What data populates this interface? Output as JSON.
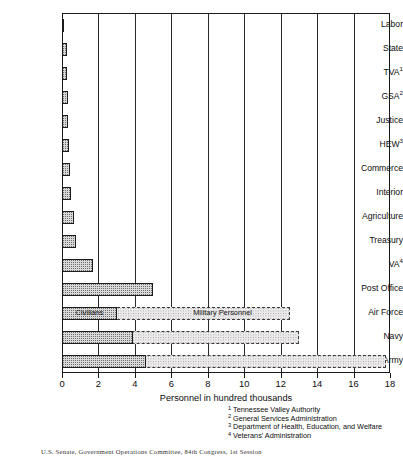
{
  "chart_data": {
    "type": "bar",
    "orientation": "horizontal",
    "title": "",
    "xlabel": "Personnel in hundred thousands",
    "ylabel": "",
    "xlim": [
      0,
      18
    ],
    "xticks": [
      0,
      2,
      4,
      6,
      8,
      10,
      12,
      14,
      16,
      18
    ],
    "grid": "vertical",
    "legend_position": "inside-bars",
    "categories": [
      "Labor",
      "State",
      "TVA",
      "GSA",
      "Justice",
      "HEW",
      "Commerce",
      "Interior",
      "Agriculture",
      "Treasury",
      "VA",
      "Post Office",
      "Air Force",
      "Navy",
      "Army"
    ],
    "category_labels": [
      {
        "text": "Labor",
        "sup": ""
      },
      {
        "text": "State",
        "sup": ""
      },
      {
        "text": "TVA",
        "sup": "1"
      },
      {
        "text": "GSA",
        "sup": "2"
      },
      {
        "text": "Justice",
        "sup": ""
      },
      {
        "text": "HEW",
        "sup": "3"
      },
      {
        "text": "Commerce",
        "sup": ""
      },
      {
        "text": "Interior",
        "sup": ""
      },
      {
        "text": "Agriculture",
        "sup": ""
      },
      {
        "text": "Treasury",
        "sup": ""
      },
      {
        "text": "VA",
        "sup": "4"
      },
      {
        "text": "Post Office",
        "sup": ""
      },
      {
        "text": "Air Force",
        "sup": ""
      },
      {
        "text": "Navy",
        "sup": ""
      },
      {
        "text": "Army",
        "sup": ""
      }
    ],
    "series": [
      {
        "name": "Civilians",
        "values": [
          0.1,
          0.25,
          0.3,
          0.32,
          0.35,
          0.4,
          0.45,
          0.5,
          0.65,
          0.75,
          1.7,
          5.0,
          3.0,
          3.9,
          4.6
        ]
      },
      {
        "name": "Military Personnel",
        "values": [
          0,
          0,
          0,
          0,
          0,
          0,
          0,
          0,
          0,
          0,
          0,
          0,
          12.5,
          13.0,
          17.8
        ]
      }
    ],
    "bar_captions": [
      {
        "series": "Civilians",
        "category": "Air Force",
        "label": "Civilians"
      },
      {
        "series": "Military Personnel",
        "category": "Air Force",
        "label": "Military Personnel"
      }
    ]
  },
  "footnotes": [
    {
      "num": "1",
      "text": "Tennessee Valley Authority"
    },
    {
      "num": "2",
      "text": "General Services Administration"
    },
    {
      "num": "3",
      "text": "Department of Health, Education, and Welfare"
    },
    {
      "num": "4",
      "text": "Veterans' Administration"
    }
  ],
  "source": "U.S. Senate, Government Operations Committee, 84th Congress, 1st Session"
}
